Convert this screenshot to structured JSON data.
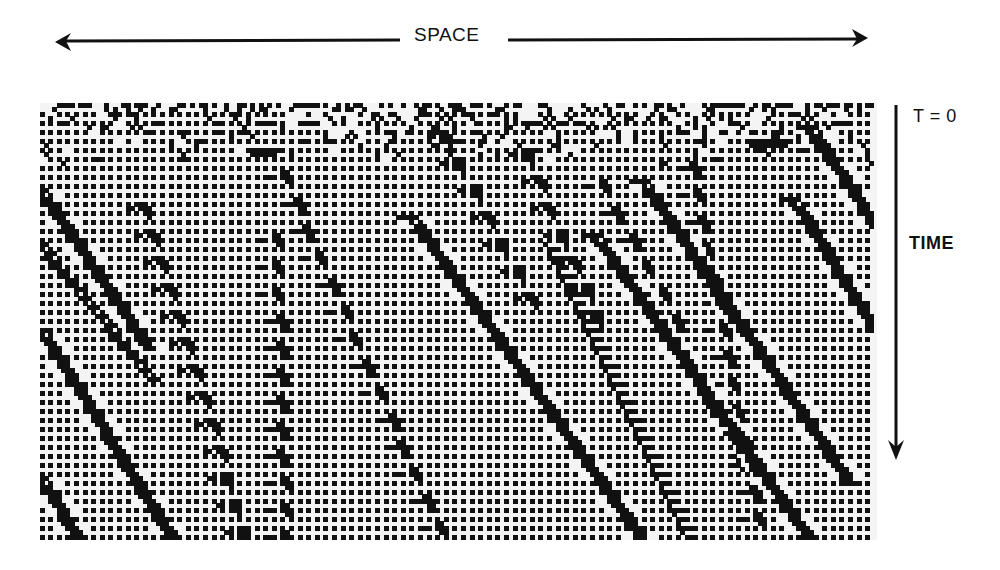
{
  "figure": {
    "space_axis_label": "SPACE",
    "time_origin_label": "T = 0",
    "time_axis_label": "TIME",
    "colors": {
      "ink": "#111111",
      "background": "#ffffff",
      "plot_background": "#f4f4f4"
    }
  },
  "axes": {
    "space_arrow": {
      "x1": 55,
      "x2": 868,
      "y": 40,
      "gap_start": 400,
      "gap_end": 508
    },
    "time_arrow": {
      "x": 896,
      "y1": 105,
      "y2": 460
    }
  },
  "lattice": {
    "origin": [
      40,
      103
    ],
    "width": 837,
    "height": 437,
    "cell_w": 4.3,
    "cell_h": 4.5,
    "dot_pattern": "alternating cells on every other column and row"
  },
  "particles": {
    "thick_lines": [
      {
        "id": "A",
        "from": [
          40,
          190
        ],
        "to": [
          148,
          345
        ],
        "width": 6
      },
      {
        "id": "B",
        "from": [
          40,
          328
        ],
        "to": [
          172,
          540
        ],
        "width": 6
      },
      {
        "id": "C",
        "from": [
          40,
          478
        ],
        "to": [
          78,
          540
        ],
        "width": 6
      },
      {
        "id": "D",
        "from": [
          408,
          215
        ],
        "to": [
          640,
          540
        ],
        "width": 6
      },
      {
        "id": "E",
        "from": [
          593,
          233
        ],
        "to": [
          810,
          540
        ],
        "width": 6
      },
      {
        "id": "E2",
        "from": [
          640,
          180
        ],
        "to": [
          850,
          480
        ],
        "width": 6
      },
      {
        "id": "F",
        "from": [
          793,
          196
        ],
        "to": [
          876,
          330
        ],
        "width": 6
      },
      {
        "id": "G",
        "from": [
          808,
          125
        ],
        "to": [
          876,
          225
        ],
        "width": 6
      }
    ],
    "arrowhead_tracks": [
      {
        "id": "t1",
        "from": [
          140,
          200
        ],
        "to": [
          242,
          535
        ]
      },
      {
        "id": "t2",
        "from": [
          272,
          235
        ],
        "to": [
          280,
          535
        ]
      },
      {
        "id": "t3",
        "from": [
          282,
          170
        ],
        "to": [
          442,
          535
        ]
      },
      {
        "id": "t4",
        "from": [
          440,
          130
        ],
        "to": [
          530,
          300
        ]
      },
      {
        "id": "t5",
        "from": [
          520,
          150
        ],
        "to": [
          600,
          330
        ]
      },
      {
        "id": "t6",
        "from": [
          690,
          160
        ],
        "to": [
          760,
          535
        ]
      },
      {
        "id": "t7",
        "from": [
          600,
          180
        ],
        "to": [
          680,
          330
        ]
      }
    ],
    "striped_wakes": [
      {
        "from": [
          40,
          235
        ],
        "to": [
          165,
          380
        ]
      },
      {
        "from": [
          560,
          245
        ],
        "to": [
          700,
          540
        ]
      },
      {
        "from": [
          690,
          350
        ],
        "to": [
          760,
          470
        ]
      }
    ],
    "blobs": [
      {
        "at": [
          248,
          150
        ],
        "w": 36,
        "h": 8
      },
      {
        "at": [
          745,
          138
        ],
        "w": 48,
        "h": 10
      }
    ]
  }
}
